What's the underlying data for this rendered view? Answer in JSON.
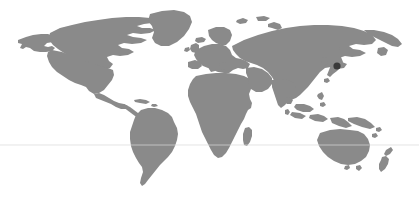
{
  "figure": {
    "kind": "world-map",
    "projection": "equirectangular",
    "width": 419,
    "height": 200,
    "background_color": "#ffffff",
    "land_color": "#8a8a8a",
    "graticule_color": "#d8d8d8",
    "marker_color": "#3a3a3a",
    "title": "",
    "caption": "",
    "legend": []
  },
  "graticule": {
    "lines": [
      {
        "name": "latitude-line",
        "y": 145,
        "x_start": 0,
        "x_end": 419
      }
    ]
  },
  "markers": [
    {
      "name": "japan-marker",
      "label": "",
      "x": 337,
      "y": 66,
      "radius": 3.6,
      "color": "#3a3a3a"
    }
  ],
  "regions": [
    {
      "name": "north-america",
      "label": ""
    },
    {
      "name": "greenland",
      "label": ""
    },
    {
      "name": "south-america",
      "label": ""
    },
    {
      "name": "africa",
      "label": ""
    },
    {
      "name": "europe",
      "label": ""
    },
    {
      "name": "asia",
      "label": ""
    },
    {
      "name": "japan",
      "label": ""
    },
    {
      "name": "southeast-asia-islands",
      "label": ""
    },
    {
      "name": "australia",
      "label": ""
    },
    {
      "name": "new-zealand",
      "label": ""
    },
    {
      "name": "british-isles",
      "label": ""
    },
    {
      "name": "madagascar",
      "label": ""
    },
    {
      "name": "iceland",
      "label": ""
    },
    {
      "name": "caribbean",
      "label": ""
    },
    {
      "name": "philippines",
      "label": ""
    },
    {
      "name": "sri-lanka",
      "label": ""
    },
    {
      "name": "kamchatka",
      "label": ""
    }
  ]
}
